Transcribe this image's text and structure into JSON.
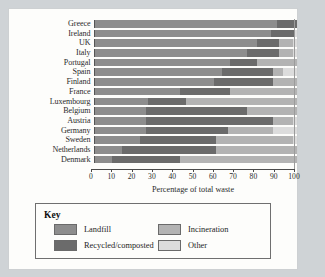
{
  "chart_data": {
    "type": "bar",
    "orientation": "horizontal",
    "stacked": true,
    "title": "",
    "xlabel": "Percentage of total waste",
    "ylabel": "",
    "xlim": [
      0,
      100
    ],
    "grid": false,
    "tick_labels": [
      "0",
      "10",
      "20",
      "30",
      "40",
      "50",
      "60",
      "70",
      "80",
      "90",
      "100"
    ],
    "tick_values": [
      0,
      10,
      20,
      30,
      40,
      50,
      60,
      70,
      80,
      90,
      100
    ],
    "categories": [
      "Greece",
      "Ireland",
      "UK",
      "Italy",
      "Portugal",
      "Spain",
      "Finland",
      "France",
      "Luxembourg",
      "Belgium",
      "Austria",
      "Germany",
      "Sweden",
      "Netherlands",
      "Denmark"
    ],
    "series": [
      {
        "name": "Landfill",
        "color": "#8d8d8d",
        "values": [
          90,
          87,
          80,
          75,
          67,
          63,
          59,
          42,
          26,
          25,
          25,
          25,
          22,
          13,
          8
        ]
      },
      {
        "name": "Recycled/composted",
        "color": "#6b6b6b",
        "values": [
          10,
          12,
          11,
          16,
          13,
          25,
          29,
          25,
          19,
          50,
          63,
          41,
          38,
          47,
          34
        ]
      },
      {
        "name": "Incineration",
        "color": "#b3b3b3",
        "values": [
          0,
          0,
          7,
          7,
          20,
          5,
          12,
          33,
          55,
          25,
          10,
          22,
          38,
          40,
          58
        ]
      },
      {
        "name": "Other",
        "color": "#dcdcdc",
        "values": [
          0,
          1,
          2,
          2,
          0,
          7,
          0,
          0,
          0,
          0,
          2,
          12,
          2,
          0,
          0
        ]
      }
    ]
  },
  "legend": {
    "title": "Key",
    "items": [
      {
        "label": "Landfill",
        "color": "#8d8d8d"
      },
      {
        "label": "Incineration",
        "color": "#b3b3b3"
      },
      {
        "label": "Recycled/composted",
        "color": "#6b6b6b"
      },
      {
        "label": "Other",
        "color": "#dcdcdc"
      }
    ]
  }
}
